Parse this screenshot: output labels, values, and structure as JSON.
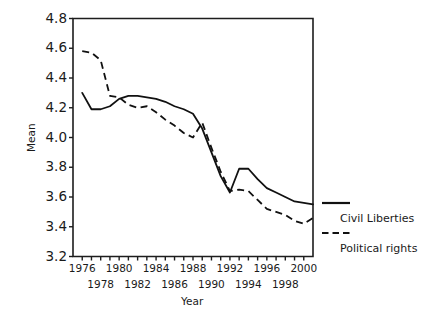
{
  "chart_data": {
    "type": "line",
    "title": "",
    "xlabel": "Year",
    "ylabel": "Mean",
    "xlim": [
      1975,
      2001
    ],
    "ylim": [
      3.2,
      4.8
    ],
    "grid": false,
    "legend_position": "right",
    "x": [
      1976,
      1977,
      1978,
      1979,
      1980,
      1981,
      1982,
      1983,
      1984,
      1985,
      1986,
      1987,
      1988,
      1989,
      1990,
      1991,
      1992,
      1993,
      1994,
      1995,
      1996,
      1997,
      1998,
      1999,
      2000,
      2001
    ],
    "yticks": [
      "3.2",
      "3.4",
      "3.6",
      "3.8",
      "4.0",
      "4.2",
      "4.4",
      "4.6",
      "4.8"
    ],
    "xticks_upper": [
      "1976",
      "1980",
      "1984",
      "1988",
      "1992",
      "1996",
      "2000"
    ],
    "xticks_lower": [
      "1978",
      "1982",
      "1986",
      "1990",
      "1994",
      "1998"
    ],
    "series": [
      {
        "name": "Civil Liberties",
        "style": "solid",
        "color": "#111111",
        "values": [
          4.3,
          4.19,
          4.19,
          4.21,
          4.26,
          4.28,
          4.28,
          4.27,
          4.26,
          4.24,
          4.21,
          4.19,
          4.16,
          4.06,
          3.9,
          3.74,
          3.63,
          3.79,
          3.79,
          3.72,
          3.66,
          3.63,
          3.6,
          3.57,
          3.56,
          3.55
        ]
      },
      {
        "name": "Political rights",
        "style": "dashed",
        "color": "#111111",
        "values": [
          4.58,
          4.57,
          4.52,
          4.28,
          4.27,
          4.22,
          4.2,
          4.21,
          4.17,
          4.12,
          4.08,
          4.03,
          4.0,
          4.1,
          3.93,
          3.77,
          3.64,
          3.65,
          3.64,
          3.58,
          3.52,
          3.5,
          3.48,
          3.44,
          3.42,
          3.46
        ]
      }
    ]
  },
  "legend": {
    "items": [
      {
        "label": "Civil Liberties",
        "style": "solid"
      },
      {
        "label": "Political rights",
        "style": "dashed"
      }
    ]
  }
}
